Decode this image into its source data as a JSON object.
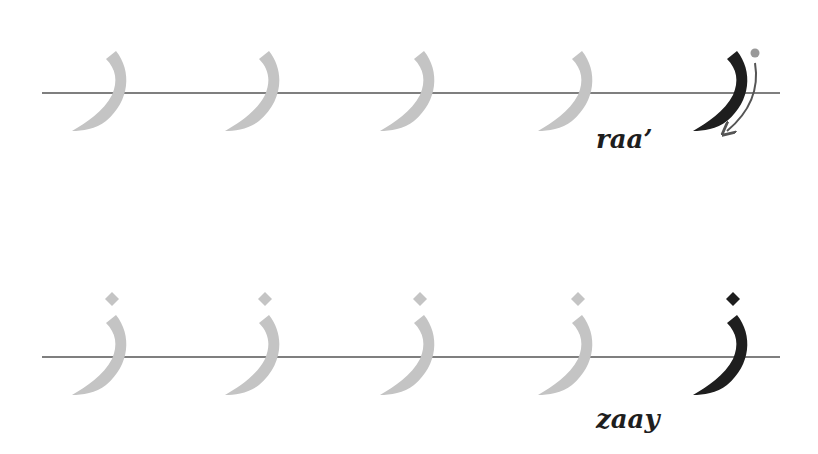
{
  "rows": [
    {
      "name": "raa",
      "label": "raa’",
      "baseline_y": 93,
      "practice_x": [
        112,
        265,
        420,
        578
      ],
      "model_x": 733,
      "has_dot": false,
      "show_stroke_arrow": true,
      "label_pos": {
        "x": 596,
        "y": 128
      }
    },
    {
      "name": "zaay",
      "label": "zaay",
      "baseline_y": 357,
      "practice_x": [
        112,
        265,
        420,
        578
      ],
      "model_x": 733,
      "has_dot": true,
      "show_stroke_arrow": false,
      "label_pos": {
        "x": 596,
        "y": 408
      }
    }
  ],
  "baseline": {
    "x1": 42,
    "x2": 780,
    "color": "#555555"
  },
  "colors": {
    "practice": "#c4c4c4",
    "model": "#1e1e1e",
    "arrow": "#555555",
    "start_dot": "#999999"
  }
}
